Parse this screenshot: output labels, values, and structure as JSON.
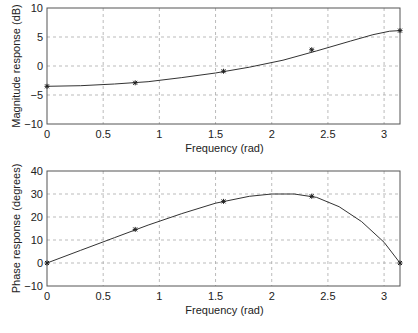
{
  "chart_data": [
    {
      "type": "line",
      "title": "",
      "xlabel": "Frequency (rad)",
      "ylabel": "Magnitude response (dB)",
      "xlim": [
        0,
        3.1416
      ],
      "ylim": [
        -10,
        10
      ],
      "xticks": [
        0,
        0.5,
        1,
        1.5,
        2,
        2.5,
        3
      ],
      "xtick_labels": [
        "0",
        "0.5",
        "1",
        "1.5",
        "2",
        "2.5",
        "3"
      ],
      "yticks": [
        -10,
        -5,
        0,
        5,
        10
      ],
      "ytick_labels": [
        "−10",
        "−5",
        "0",
        "5",
        "10"
      ],
      "grid": true,
      "series": [
        {
          "name": "response",
          "x": [
            0,
            0.3,
            0.6,
            0.9,
            1.2,
            1.5,
            1.8,
            2.1,
            2.4,
            2.7,
            2.9,
            3.05,
            3.1416
          ],
          "values": [
            -3.5,
            -3.4,
            -3.1,
            -2.7,
            -2.0,
            -1.2,
            -0.2,
            1.0,
            2.6,
            4.3,
            5.4,
            6.0,
            6.1
          ]
        },
        {
          "name": "samples",
          "x": [
            0,
            0.785,
            1.571,
            2.356,
            3.1416
          ],
          "values": [
            -3.5,
            -2.9,
            -0.9,
            2.8,
            6.1
          ],
          "marker": "*"
        }
      ]
    },
    {
      "type": "line",
      "title": "",
      "xlabel": "Frequency (rad)",
      "ylabel": "Phase response (degrees)",
      "xlim": [
        0,
        3.1416
      ],
      "ylim": [
        -10,
        40
      ],
      "xticks": [
        0,
        0.5,
        1,
        1.5,
        2,
        2.5,
        3
      ],
      "xtick_labels": [
        "0",
        "0.5",
        "1",
        "1.5",
        "2",
        "2.5",
        "3"
      ],
      "yticks": [
        -10,
        0,
        10,
        20,
        30,
        40
      ],
      "ytick_labels": [
        "−10",
        "0",
        "10",
        "20",
        "30",
        "40"
      ],
      "grid": true,
      "series": [
        {
          "name": "response",
          "x": [
            0,
            0.3,
            0.6,
            0.9,
            1.2,
            1.5,
            1.8,
            2.0,
            2.2,
            2.4,
            2.6,
            2.8,
            3.0,
            3.1416
          ],
          "values": [
            0,
            5.5,
            11,
            16.5,
            21.5,
            26,
            29,
            30,
            30,
            28.5,
            24.5,
            18,
            9,
            0
          ]
        },
        {
          "name": "samples",
          "x": [
            0,
            0.785,
            1.571,
            2.356,
            3.1416
          ],
          "values": [
            0,
            14.6,
            26.8,
            29.0,
            0
          ],
          "marker": "*"
        }
      ]
    }
  ]
}
